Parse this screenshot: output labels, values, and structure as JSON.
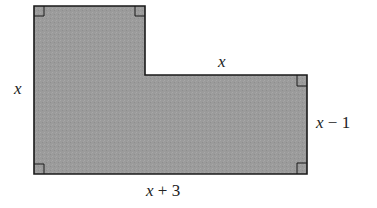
{
  "diagram": {
    "shape": "L-shaped polygon",
    "fill_color": "#9a9a9a",
    "stroke_color": "#1a1a1a",
    "labels": {
      "left_side": "x",
      "top_right_segment": "x",
      "right_side": "x − 1",
      "bottom_side": "x + 3"
    },
    "right_angle_markers": 5
  }
}
